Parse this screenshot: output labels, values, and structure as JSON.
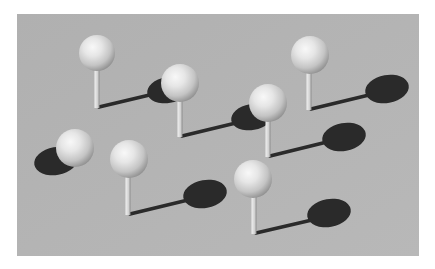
{
  "image": {
    "description": "3D render of white spheres on thin vertical stems over a gray plane, each casting a dark elliptical shadow with a thin stem shadow",
    "colors": {
      "page_background": "#ffffff",
      "plane": "#b4b4b4",
      "shadow": "#2a2a2a",
      "sphere_highlight": "#f6f6f6",
      "sphere_mid": "#d8d8d8",
      "sphere_dark": "#8e8e8e",
      "stem_light": "#ececec",
      "stem_dark": "#9a9a9a"
    },
    "plane": {
      "x": 17,
      "y": 14,
      "width": 402,
      "height": 242
    },
    "objects": [
      {
        "id": "pin-1",
        "sphere": {
          "cx": 97,
          "cy": 53,
          "r": 18
        },
        "stem": {
          "x": 97,
          "top": 70,
          "bottom": 108
        },
        "shadow_line": {
          "x1": 99,
          "y1": 107,
          "x2": 158,
          "y2": 93
        },
        "shadow": {
          "cx": 168,
          "cy": 90,
          "rx": 21,
          "ry": 13
        }
      },
      {
        "id": "pin-2",
        "sphere": {
          "cx": 180,
          "cy": 83,
          "r": 19
        },
        "stem": {
          "x": 180,
          "top": 101,
          "bottom": 137
        },
        "shadow_line": {
          "x1": 182,
          "y1": 136,
          "x2": 240,
          "y2": 122
        },
        "shadow": {
          "cx": 252,
          "cy": 117,
          "rx": 21,
          "ry": 13
        }
      },
      {
        "id": "pin-3",
        "sphere": {
          "cx": 268,
          "cy": 103,
          "r": 19
        },
        "stem": {
          "x": 268,
          "top": 121,
          "bottom": 157
        },
        "shadow_line": {
          "x1": 270,
          "y1": 156,
          "x2": 327,
          "y2": 142
        },
        "shadow": {
          "cx": 344,
          "cy": 137,
          "rx": 22,
          "ry": 14
        }
      },
      {
        "id": "pin-4",
        "sphere": {
          "cx": 310,
          "cy": 55,
          "r": 19
        },
        "stem": {
          "x": 309,
          "top": 73,
          "bottom": 110
        },
        "shadow_line": {
          "x1": 311,
          "y1": 109,
          "x2": 369,
          "y2": 95
        },
        "shadow": {
          "cx": 387,
          "cy": 89,
          "rx": 22,
          "ry": 14
        }
      },
      {
        "id": "pin-5",
        "sphere": {
          "cx": 75,
          "cy": 148,
          "r": 19
        },
        "stem": null,
        "shadow_line": null,
        "shadow": {
          "cx": 56,
          "cy": 161,
          "rx": 22,
          "ry": 14
        }
      },
      {
        "id": "pin-6",
        "sphere": {
          "cx": 129,
          "cy": 159,
          "r": 19
        },
        "stem": {
          "x": 128,
          "top": 177,
          "bottom": 215
        },
        "shadow_line": {
          "x1": 130,
          "y1": 214,
          "x2": 188,
          "y2": 200
        },
        "shadow": {
          "cx": 205,
          "cy": 194,
          "rx": 22,
          "ry": 14
        }
      },
      {
        "id": "pin-7",
        "sphere": {
          "cx": 253,
          "cy": 179,
          "r": 19
        },
        "stem": {
          "x": 254,
          "top": 197,
          "bottom": 234
        },
        "shadow_line": {
          "x1": 256,
          "y1": 233,
          "x2": 312,
          "y2": 220
        },
        "shadow": {
          "cx": 329,
          "cy": 213,
          "rx": 22,
          "ry": 14
        }
      }
    ]
  }
}
